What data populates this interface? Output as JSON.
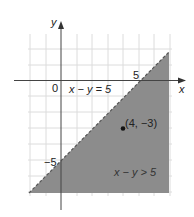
{
  "figure": {
    "axis_x_label": "x",
    "axis_y_label": "y",
    "origin_label": "0",
    "x_tick_label": "5",
    "y_tick_label": "−5",
    "boundary_equation": "x − y = 5",
    "region_label": "x − y > 5",
    "point_label": "(4, −3)",
    "point": {
      "x": 4,
      "y": -3
    },
    "boundary_style": "dashed",
    "colors": {
      "shade": "#8c8c8c",
      "grid": "#dcdcdc",
      "axis": "#444444"
    }
  }
}
